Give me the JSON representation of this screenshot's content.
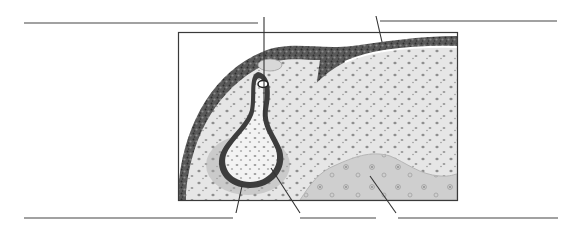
{
  "figure": {
    "style": "grayscale stippled illustration",
    "labels": [
      {
        "id": "label-top-left",
        "text": ""
      },
      {
        "id": "label-top-right",
        "text": ""
      },
      {
        "id": "label-bottom-left",
        "text": ""
      },
      {
        "id": "label-bottom-middle",
        "text": ""
      },
      {
        "id": "label-bottom-right",
        "text": ""
      }
    ],
    "colors": {
      "line": "#444444",
      "frame": "#3a3a3a",
      "epithelium": "#5e5e5e",
      "tissue_bg": "#e4e4e4",
      "nucleus": "#8a8a8a",
      "bone_region": "#c8c8c8",
      "lumen": "#f4f4f4"
    }
  }
}
